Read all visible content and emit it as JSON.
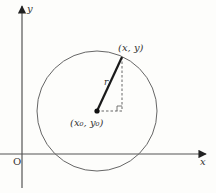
{
  "diagram": {
    "type": "circle-on-cartesian-plane",
    "colors": {
      "axis": "#555555",
      "circle": "#666666",
      "radius": "#1a1a1a",
      "dashed": "#555555",
      "background": "#fdfdfb"
    },
    "axes": {
      "x_label": "x",
      "y_label": "y",
      "origin_label": "O"
    },
    "circle": {
      "center": {
        "x": 97,
        "y": 111
      },
      "radius": 60
    },
    "points": {
      "on_circle_label": "(x, y)",
      "center_label": "(x₀, y₀)"
    },
    "radius_label": "r",
    "right_angle_marker": true
  }
}
